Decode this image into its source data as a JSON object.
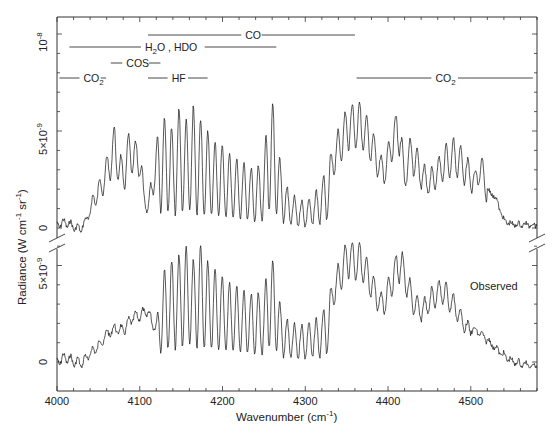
{
  "chart_data": {
    "type": "line",
    "title": "",
    "xlabel": "Wavenumber (cm",
    "xlabel_sup": "-1",
    "xlabel_end": ")",
    "ylabel": "Radiance (W cm",
    "ylabel_sup1": "-1",
    "ylabel_mid": " sr",
    "ylabel_sup2": "-1",
    "ylabel_end": ")",
    "xlim": [
      4000,
      4580
    ],
    "x_ticks": [
      4000,
      4100,
      4200,
      4300,
      4400,
      4500
    ],
    "x_tick_labels": [
      "4000",
      "4100",
      "4200",
      "4300",
      "4400",
      "4500"
    ],
    "upper_panel": {
      "ylim": [
        0,
        1.05e-08
      ],
      "y_tick_labels": [
        {
          "value": 0,
          "label": "0"
        },
        {
          "value": 5e-09,
          "label": "5×10",
          "sup": "-9"
        },
        {
          "value": 1e-08,
          "label": "10",
          "sup": "-8"
        }
      ],
      "series": [
        {
          "name": "Calculated",
          "note": "estimated envelope traced from image",
          "x": [
            4000,
            4010,
            4020,
            4030,
            4040,
            4045,
            4050,
            4055,
            4060,
            4065,
            4070,
            4075,
            4080,
            4085,
            4090,
            4095,
            4100,
            4105,
            4110,
            4115,
            4120,
            4125,
            4130,
            4135,
            4140,
            4145,
            4150,
            4155,
            4160,
            4165,
            4170,
            4175,
            4180,
            4185,
            4190,
            4195,
            4200,
            4210,
            4220,
            4230,
            4240,
            4250,
            4255,
            4260,
            4265,
            4270,
            4280,
            4290,
            4300,
            4310,
            4320,
            4330,
            4340,
            4350,
            4355,
            4360,
            4365,
            4370,
            4380,
            4390,
            4395,
            4400,
            4405,
            4410,
            4415,
            4420,
            4425,
            4430,
            4440,
            4450,
            4460,
            4470,
            4480,
            4490,
            4500,
            4505,
            4510,
            4515,
            4520,
            4530,
            4540,
            4550,
            4560,
            4570,
            4580
          ],
          "y": [
            0.5,
            0.6,
            0.4,
            0.2,
            1.2,
            2.2,
            2.5,
            3.2,
            3.8,
            4.8,
            5.5,
            4.2,
            3.5,
            4.8,
            5.3,
            4.5,
            5.1,
            2.0,
            1.5,
            3.0,
            4.5,
            6.2,
            5.8,
            6.0,
            5.0,
            6.1,
            6.5,
            5.5,
            6.2,
            6.4,
            5.5,
            5.8,
            5.0,
            5.2,
            4.5,
            4.8,
            4.4,
            3.9,
            3.6,
            3.3,
            3.2,
            3.5,
            6.4,
            6.6,
            5.8,
            3.4,
            2.0,
            1.6,
            1.5,
            1.8,
            2.6,
            3.8,
            5.2,
            6.3,
            6.6,
            6.5,
            6.7,
            6.3,
            5.3,
            4.0,
            3.6,
            4.5,
            5.6,
            6.1,
            6.0,
            3.0,
            4.6,
            4.8,
            3.6,
            3.0,
            3.8,
            4.4,
            4.8,
            4.2,
            3.4,
            3.0,
            4.0,
            3.6,
            2.2,
            1.8,
            0.6,
            0.4,
            0.4,
            0.4,
            0.4
          ]
        }
      ]
    },
    "lower_panel": {
      "ylim": [
        -4e-10,
        6.5e-09
      ],
      "y_tick_labels": [
        {
          "value": 0,
          "label": "0"
        },
        {
          "value": 5e-09,
          "label": "5×10",
          "sup": "-9"
        }
      ],
      "series": [
        {
          "name": "Observed",
          "note": "estimated envelope traced from image",
          "x": [
            4000,
            4010,
            4020,
            4030,
            4040,
            4050,
            4060,
            4070,
            4080,
            4090,
            4100,
            4110,
            4115,
            4120,
            4125,
            4130,
            4140,
            4150,
            4160,
            4165,
            4170,
            4175,
            4180,
            4190,
            4200,
            4210,
            4220,
            4230,
            4240,
            4250,
            4255,
            4260,
            4265,
            4270,
            4280,
            4290,
            4300,
            4310,
            4320,
            4330,
            4340,
            4350,
            4355,
            4360,
            4365,
            4370,
            4380,
            4390,
            4395,
            4400,
            4410,
            4415,
            4420,
            4430,
            4440,
            4450,
            4460,
            4465,
            4470,
            4480,
            4490,
            4500,
            4510,
            4520,
            4530,
            4540,
            4550,
            4560,
            4570,
            4580
          ],
          "y": [
            0.4,
            0.6,
            0.4,
            0.3,
            0.8,
            1.2,
            1.8,
            2.1,
            2.0,
            2.6,
            2.8,
            3.0,
            2.4,
            2.2,
            4.2,
            5.0,
            5.4,
            5.8,
            6.2,
            5.3,
            6.0,
            6.3,
            5.4,
            5.0,
            4.6,
            4.2,
            4.0,
            3.6,
            3.8,
            3.4,
            5.6,
            5.4,
            4.8,
            3.0,
            2.2,
            2.0,
            2.1,
            2.3,
            2.6,
            3.8,
            5.2,
            6.4,
            6.5,
            6.2,
            6.4,
            6.0,
            4.8,
            3.8,
            3.6,
            4.5,
            5.8,
            6.2,
            5.4,
            3.8,
            3.2,
            3.8,
            4.4,
            4.5,
            4.2,
            3.6,
            2.6,
            2.0,
            1.8,
            1.4,
            1.0,
            0.6,
            0.3,
            0.2,
            0.1,
            0.1
          ]
        }
      ],
      "annotation": "Observed"
    },
    "band_labels": [
      {
        "label": "CO",
        "x_range": [
          4110,
          4360
        ],
        "row": 1
      },
      {
        "label": "H",
        "sub": "2",
        "label_rest": "O , HDO",
        "x_range": [
          4015,
          4265
        ],
        "row": 2
      },
      {
        "label": "COS",
        "x_range": [
          4065,
          4125
        ],
        "row": 3
      },
      {
        "label": "CO",
        "sub": "2",
        "x_range": [
          4003,
          4053
        ],
        "row": 4
      },
      {
        "label": "HF",
        "x_range": [
          4110,
          4182
        ],
        "row": 4
      },
      {
        "label": "CO",
        "sub": "2",
        "x_range": [
          4362,
          4575
        ],
        "row": 4
      }
    ],
    "grid": false,
    "legend": "none"
  }
}
